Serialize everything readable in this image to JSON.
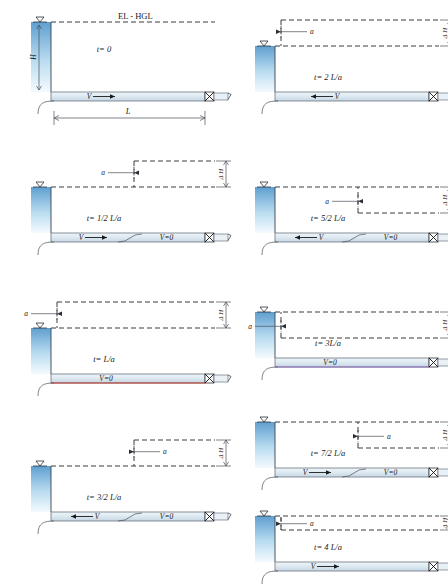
{
  "figure": {
    "hgl_label": "EL - HGL",
    "height_label": "H",
    "length_label": "L",
    "wave_speed_label": "a",
    "head_rise_label": "Δ H",
    "velocity_label": "V",
    "zero_velocity_label": "V=0",
    "caption": ""
  },
  "colors": {
    "water_top": "#5f9fd0",
    "water_bottom": "#f4fafe",
    "pipe_fill": "#dfeaf2",
    "pipe_stroke": "#6b7480",
    "line": "#262626",
    "accent_green": "#2f8f4a",
    "accent_red": "#c0392b",
    "accent_violet": "#8e6fbe"
  },
  "panels": [
    {
      "id": "t0",
      "column": "left",
      "time_label": "t= 0",
      "flow_direction": "right",
      "flow_state": "full-flow",
      "shows_hgl_label": true,
      "shows_height_dim": true,
      "shows_length_dim": true,
      "shows_wave_marker": false,
      "shows_delta_h": false,
      "wave_front_fraction": 0.0,
      "stopped_label": "",
      "moving_label": "V"
    },
    {
      "id": "t05",
      "column": "left",
      "time_label": "t= 1/2 L/a",
      "flow_direction": "right",
      "flow_state": "partial-stopped",
      "shows_hgl_label": false,
      "shows_height_dim": false,
      "shows_length_dim": false,
      "shows_wave_marker": true,
      "wave_marker_direction": "left",
      "shows_delta_h": true,
      "delta_h_sign": "positive",
      "wave_front_fraction": 0.5,
      "stopped_label": "V=0",
      "moving_label": "V"
    },
    {
      "id": "t1",
      "column": "left",
      "time_label": "t=  L/a",
      "flow_direction": "none",
      "flow_state": "all-stopped",
      "shows_hgl_label": false,
      "shows_height_dim": false,
      "shows_length_dim": false,
      "shows_wave_marker": true,
      "wave_marker_direction": "left",
      "shows_delta_h": true,
      "delta_h_sign": "positive",
      "wave_front_fraction": 1.0,
      "stopped_label": "V=0",
      "moving_label": ""
    },
    {
      "id": "t15",
      "column": "left",
      "time_label": "t= 3/2 L/a",
      "flow_direction": "left",
      "flow_state": "partial-reverse",
      "shows_hgl_label": false,
      "shows_height_dim": false,
      "shows_length_dim": false,
      "shows_wave_marker": true,
      "wave_marker_direction": "right",
      "shows_delta_h": true,
      "delta_h_sign": "positive",
      "wave_front_fraction": 0.5,
      "stopped_label": "V=0",
      "moving_label": "V"
    },
    {
      "id": "t2",
      "column": "right",
      "time_label": "t= 2 L/a",
      "flow_direction": "left",
      "flow_state": "full-reverse",
      "shows_hgl_label": false,
      "shows_height_dim": false,
      "shows_length_dim": false,
      "shows_wave_marker": true,
      "wave_marker_direction": "right",
      "shows_delta_h": true,
      "delta_h_sign": "positive",
      "wave_front_fraction": 1.0,
      "stopped_label": "",
      "moving_label": "V"
    },
    {
      "id": "t25",
      "column": "right",
      "time_label": "t= 5/2 L/a",
      "flow_direction": "left",
      "flow_state": "partial-reverse-low",
      "shows_hgl_label": false,
      "shows_height_dim": false,
      "shows_length_dim": false,
      "shows_wave_marker": true,
      "wave_marker_direction": "left",
      "shows_delta_h": true,
      "delta_h_sign": "negative",
      "wave_front_fraction": 0.5,
      "stopped_label": "V=0",
      "moving_label": "V"
    },
    {
      "id": "t3",
      "column": "right",
      "time_label": "t= 3L/a",
      "flow_direction": "none",
      "flow_state": "all-stopped-low",
      "shows_hgl_label": false,
      "shows_height_dim": false,
      "shows_length_dim": false,
      "shows_wave_marker": true,
      "wave_marker_direction": "left",
      "shows_delta_h": true,
      "delta_h_sign": "negative",
      "wave_front_fraction": 1.0,
      "stopped_label": "V=0",
      "moving_label": ""
    },
    {
      "id": "t35",
      "column": "right",
      "time_label": "t= 7/2 L/a",
      "flow_direction": "right",
      "flow_state": "partial-forward-low",
      "shows_hgl_label": false,
      "shows_height_dim": false,
      "shows_length_dim": false,
      "shows_wave_marker": true,
      "wave_marker_direction": "right",
      "shows_delta_h": true,
      "delta_h_sign": "negative",
      "wave_front_fraction": 0.5,
      "stopped_label": "V=0",
      "moving_label": "V"
    },
    {
      "id": "t4",
      "column": "right",
      "time_label": "t= 4 L/a",
      "flow_direction": "right",
      "flow_state": "full-flow",
      "shows_hgl_label": false,
      "shows_height_dim": false,
      "shows_length_dim": false,
      "shows_wave_marker": true,
      "wave_marker_direction": "right",
      "shows_delta_h": true,
      "delta_h_sign": "negative-small",
      "wave_front_fraction": 1.0,
      "stopped_label": "",
      "moving_label": "V"
    }
  ]
}
